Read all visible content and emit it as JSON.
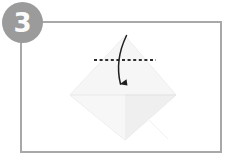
{
  "step": {
    "number": "3",
    "badge_color": "#9b9b9b",
    "badge_text_color": "#fbfbfb"
  },
  "frame": {
    "border_color": "#a8a8a8",
    "background_color": "#ffffff"
  },
  "diagram": {
    "paper": {
      "shape": "diamond",
      "fill_color": "#f4f4f4",
      "shade_color": "#ececec",
      "edge_color": "#e2e2e2",
      "top_point": "125,36",
      "right_point": "176,95",
      "bottom_point": "125,140",
      "left_point": "70,95"
    },
    "fold_line": {
      "style": "dashed",
      "color": "#2e2e2e",
      "orientation": "horizontal",
      "x_start": "94",
      "x_end": "156",
      "y": "60"
    },
    "arrow": {
      "color": "#1f1f1f",
      "direction": "down",
      "label": "fold top corner down"
    }
  }
}
